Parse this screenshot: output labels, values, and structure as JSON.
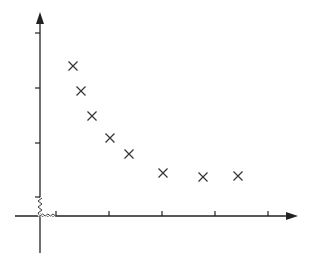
{
  "chart_data": {
    "type": "scatter",
    "title": "",
    "xlabel": "",
    "ylabel": "",
    "marker": "x",
    "grid": false,
    "legend": null,
    "axis_breaks": {
      "x": true,
      "y": true
    },
    "x_ticks_px": [
      56,
      109,
      162,
      215,
      268
    ],
    "y_ticks_px": [
      33,
      88,
      143,
      197
    ],
    "origin_px": [
      40,
      216
    ],
    "points_px": [
      [
        73,
        66
      ],
      [
        81,
        91
      ],
      [
        92,
        116
      ],
      [
        110,
        138
      ],
      [
        129,
        154
      ],
      [
        163,
        173
      ],
      [
        203,
        177
      ],
      [
        238,
        176
      ]
    ],
    "x": [
      0.32,
      0.47,
      0.68,
      1.02,
      1.38,
      2.02,
      2.77,
      3.43
    ],
    "y": [
      2.39,
      1.94,
      1.49,
      1.09,
      0.8,
      0.45,
      0.38,
      0.4
    ]
  },
  "colors": {
    "axis": "#222222",
    "marker": "#333333",
    "background": "#ffffff"
  }
}
